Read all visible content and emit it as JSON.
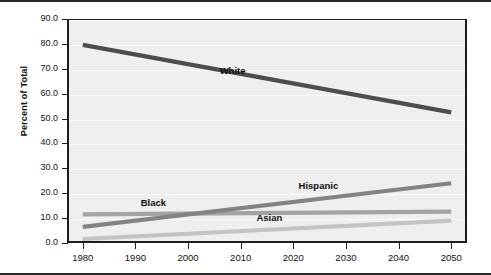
{
  "chart_data": {
    "type": "line",
    "title": "",
    "xlabel": "",
    "ylabel": "Percent of Total",
    "x": [
      1980,
      1990,
      2000,
      2010,
      2020,
      2030,
      2040,
      2050
    ],
    "xlim": [
      1977,
      2053
    ],
    "ylim": [
      0.0,
      90.0
    ],
    "ytick_labels": [
      "0.0",
      "10.0",
      "20.0",
      "30.0",
      "40.0",
      "50.0",
      "60.0",
      "70.0",
      "80.0",
      "90.0"
    ],
    "ytick_values": [
      0.0,
      10.0,
      20.0,
      30.0,
      40.0,
      50.0,
      60.0,
      70.0,
      80.0,
      90.0
    ],
    "xtick_labels": [
      "1980",
      "1990",
      "2000",
      "2010",
      "2020",
      "2030",
      "2040",
      "2050"
    ],
    "grid": true,
    "legend": "inline-labels",
    "plot_background": "#efefef",
    "series": [
      {
        "name": "White",
        "label": "White",
        "color": "#4d4d4d",
        "width": 4.2,
        "endpoints": [
          {
            "x": 1980,
            "y": 79.6
          },
          {
            "x": 2050,
            "y": 52.5
          }
        ],
        "values": [
          79.6,
          75.7,
          71.8,
          67.9,
          64.0,
          60.2,
          56.3,
          52.5
        ],
        "label_x": 2006,
        "label_y": 69.0
      },
      {
        "name": "Hispanic",
        "label": "Hispanic",
        "color": "#838383",
        "width": 4.2,
        "endpoints": [
          {
            "x": 1980,
            "y": 6.5
          },
          {
            "x": 2050,
            "y": 24.0
          }
        ],
        "values": [
          6.5,
          9.0,
          11.5,
          14.0,
          16.5,
          19.0,
          21.5,
          24.0
        ],
        "label_x": 2021,
        "label_y": 23.0
      },
      {
        "name": "Black",
        "label": "Black",
        "color": "#a3a3a3",
        "width": 4.2,
        "endpoints": [
          {
            "x": 1980,
            "y": 11.5
          },
          {
            "x": 2050,
            "y": 12.6
          }
        ],
        "values": [
          11.5,
          11.7,
          11.8,
          11.9,
          12.1,
          12.3,
          12.4,
          12.6
        ],
        "label_x": 1991,
        "label_y": 16.0
      },
      {
        "name": "Asian",
        "label": "Asian",
        "color": "#c4c4c4",
        "width": 4.2,
        "endpoints": [
          {
            "x": 1980,
            "y": 1.6
          },
          {
            "x": 2050,
            "y": 9.0
          }
        ],
        "values": [
          1.6,
          2.6,
          3.7,
          4.8,
          5.8,
          6.9,
          7.9,
          9.0
        ],
        "label_x": 2013,
        "label_y": 9.9
      }
    ]
  }
}
